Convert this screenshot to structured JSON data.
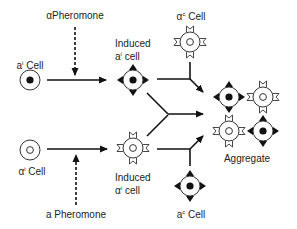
{
  "diagram": {
    "labels": {
      "alpha_pheromone": "αPheromone",
      "a_pheromone": "a Pheromone",
      "a_i_cell": {
        "base": "a",
        "sup": "i",
        "suffix": " Cell"
      },
      "alpha_i_cell": {
        "base": "α",
        "sup": "i",
        "suffix": " Cell"
      },
      "induced_a_line1": "Induced",
      "induced_a_line2": {
        "base": "a",
        "sup": "i",
        "suffix": " cell"
      },
      "induced_alpha_line1": "Induced",
      "induced_alpha_line2": {
        "base": "α",
        "sup": "i",
        "suffix": " cell"
      },
      "alpha_c_cell": {
        "base": "α",
        "sup": "c",
        "suffix": " Cell"
      },
      "a_c_cell": {
        "base": "a",
        "sup": "c",
        "suffix": " Cell"
      },
      "aggregate": "Aggregate"
    },
    "nodes": [
      {
        "id": "a_i",
        "type": "plain-a"
      },
      {
        "id": "alpha_i",
        "type": "plain-alpha"
      },
      {
        "id": "induced_a",
        "type": "induced-a"
      },
      {
        "id": "induced_alpha",
        "type": "induced-alpha"
      },
      {
        "id": "alpha_c",
        "type": "constitutive-alpha"
      },
      {
        "id": "a_c",
        "type": "constitutive-a"
      },
      {
        "id": "aggregate",
        "type": "aggregate",
        "cells": [
          "a",
          "alpha",
          "alpha",
          "a"
        ]
      }
    ],
    "edges": [
      {
        "from": "a_i",
        "to": "induced_a",
        "style": "solid"
      },
      {
        "from": "alpha_pheromone",
        "to": "a_i->induced_a",
        "style": "dashed"
      },
      {
        "from": "alpha_i",
        "to": "induced_alpha",
        "style": "solid"
      },
      {
        "from": "a_pheromone",
        "to": "alpha_i->induced_alpha",
        "style": "dashed"
      },
      {
        "from": "induced_a",
        "to": "aggregate",
        "style": "solid",
        "joined_with": "alpha_c"
      },
      {
        "from": "induced_alpha",
        "to": "aggregate",
        "style": "solid",
        "joined_with": "a_c"
      },
      {
        "from": "induced_a+induced_alpha",
        "to": "aggregate",
        "style": "solid"
      }
    ]
  }
}
